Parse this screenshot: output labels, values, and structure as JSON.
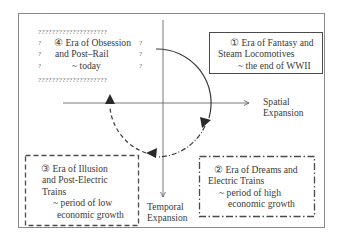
{
  "diagram": {
    "axes": {
      "horizontal": {
        "label_lines": [
          "Spatial",
          "Expansion"
        ]
      },
      "vertical": {
        "label_lines": [
          "Temporal",
          "Expansion"
        ]
      }
    },
    "eras": [
      {
        "number": 1,
        "border_style": "solid",
        "lines": [
          "① Era of Fantasy and",
          "Steam Locomotives",
          "~ the end of WWII"
        ]
      },
      {
        "number": 2,
        "border_style": "dash-dot",
        "lines": [
          "② Era of Dreams and",
          "Electric Trains",
          "~ period of high",
          "economic growth"
        ]
      },
      {
        "number": 3,
        "border_style": "dashed",
        "lines": [
          "③ Era of Illusion",
          "and Post-Electric",
          "Trains",
          "~ period of low",
          "economic growth"
        ]
      },
      {
        "number": 4,
        "border_style": "question-marks",
        "border_glyph_row": "????????????????????",
        "border_glyph_col": [
          "?",
          "?",
          "?"
        ],
        "lines": [
          "④ Era of Obsession",
          "and Post–Rail",
          "~ today"
        ]
      }
    ],
    "cycle_arrows": [
      {
        "from_era": 1,
        "to_era": 2,
        "style": "solid"
      },
      {
        "from_era": 2,
        "to_era": 3,
        "style": "dash-dot"
      },
      {
        "from_era": 3,
        "to_era": 4,
        "style": "dashed"
      }
    ],
    "colors": {
      "line": "#3a3a3a",
      "frame": "#8a8a8a",
      "text": "#3a3a3a"
    }
  }
}
